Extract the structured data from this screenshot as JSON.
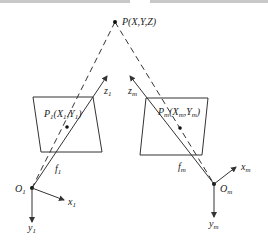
{
  "diagram": {
    "type": "stereo camera projection geometry",
    "point": {
      "label": "P(X,Y,Z)"
    },
    "left_camera": {
      "image_point_label": "P1(X1,Y1)",
      "image_point_main": "P",
      "image_point_sub": "1",
      "optical_axis_label": "z",
      "optical_axis_sub": "1",
      "focal_label": "f",
      "focal_sub": "1",
      "origin_label": "O",
      "origin_sub": "1",
      "x_axis_label": "x",
      "x_axis_sub": "1",
      "y_axis_label": "y",
      "y_axis_sub": "1",
      "coord_X": "X",
      "coord_X_sub": "1",
      "coord_Y": "Y",
      "coord_Y_sub": "1"
    },
    "right_camera": {
      "image_point_label": "Pm(Xm,Ym)",
      "image_point_main": "P",
      "image_point_sub": "m",
      "optical_axis_label": "z",
      "optical_axis_sub": "m",
      "focal_label": "f",
      "focal_sub": "m",
      "origin_label": "O",
      "origin_sub": "m",
      "x_axis_label": "x",
      "x_axis_sub": "m",
      "y_axis_label": "y",
      "y_axis_sub": "m",
      "coord_X": "X",
      "coord_X_sub": "m",
      "coord_Y": "Y",
      "coord_Y_sub": "m"
    },
    "colors": {
      "stroke": "#333333",
      "text": "#222222"
    }
  }
}
